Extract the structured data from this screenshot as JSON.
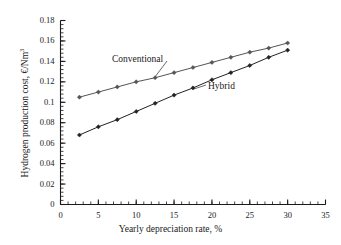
{
  "chart_data": {
    "type": "line",
    "title": "",
    "xlabel": "Yearly depreciation rate, %",
    "ylabel": "Hydrogen production cost, €/Nm3",
    "ylabel_base": "Hydrogen production cost, €/Nm",
    "ylabel_exponent": "3",
    "xlim": [
      0,
      35
    ],
    "ylim": [
      0,
      0.18
    ],
    "xticks": [
      0,
      5,
      10,
      15,
      20,
      25,
      30,
      35
    ],
    "xtick_labels": [
      "0",
      "5",
      "10",
      "15",
      "20",
      "25",
      "30",
      "35"
    ],
    "yticks": [
      0,
      0.02,
      0.04,
      0.06,
      0.08,
      0.1,
      0.12,
      0.14,
      0.16,
      0.18
    ],
    "ytick_labels": [
      "0",
      "0.02",
      "0.04",
      "0.06",
      "0.08",
      "0.1",
      "0.12",
      "0.14",
      "0.16",
      "0.18"
    ],
    "grid": false,
    "legend_position": "inline-annotation",
    "x": [
      2.5,
      5,
      7.5,
      10,
      12.5,
      15,
      17.5,
      20,
      22.5,
      25,
      27.5,
      30
    ],
    "series": [
      {
        "name": "Conventional",
        "color": "#555555",
        "marker": "diamond",
        "values": [
          0.105,
          0.11,
          0.115,
          0.12,
          0.124,
          0.129,
          0.134,
          0.139,
          0.144,
          0.149,
          0.153,
          0.158
        ]
      },
      {
        "name": "Hybrid",
        "color": "#222222",
        "marker": "diamond",
        "values": [
          0.068,
          0.076,
          0.083,
          0.091,
          0.099,
          0.107,
          0.114,
          0.122,
          0.129,
          0.136,
          0.144,
          0.151
        ]
      }
    ],
    "annotations": [
      {
        "text": "Conventional",
        "series": "Conventional"
      },
      {
        "text": "Hybrid",
        "series": "Hybrid"
      }
    ]
  }
}
